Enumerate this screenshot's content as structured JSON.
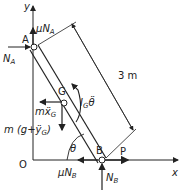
{
  "figure": {
    "axes": {
      "x_label": "x",
      "y_label": "y",
      "origin_label": "O"
    },
    "points": {
      "A": "A",
      "B": "B",
      "G": "G"
    },
    "length_label": "3 m",
    "angle_label": "θ",
    "forces": {
      "N_A": {
        "main": "N",
        "sub": "A"
      },
      "mu_N_A": {
        "prefix": "μ",
        "main": "N",
        "sub": "A"
      },
      "N_B": {
        "main": "N",
        "sub": "B"
      },
      "mu_N_B": {
        "prefix": "μ",
        "main": "N",
        "sub": "B"
      },
      "P": "P",
      "inertia_x": {
        "main": "mẍ",
        "sub": "G"
      },
      "weight": {
        "pre": "m (g+ÿ",
        "sub": "G",
        "post": ")"
      },
      "moment": {
        "main": "I",
        "sub": "G",
        "post": "θ̈"
      }
    }
  }
}
